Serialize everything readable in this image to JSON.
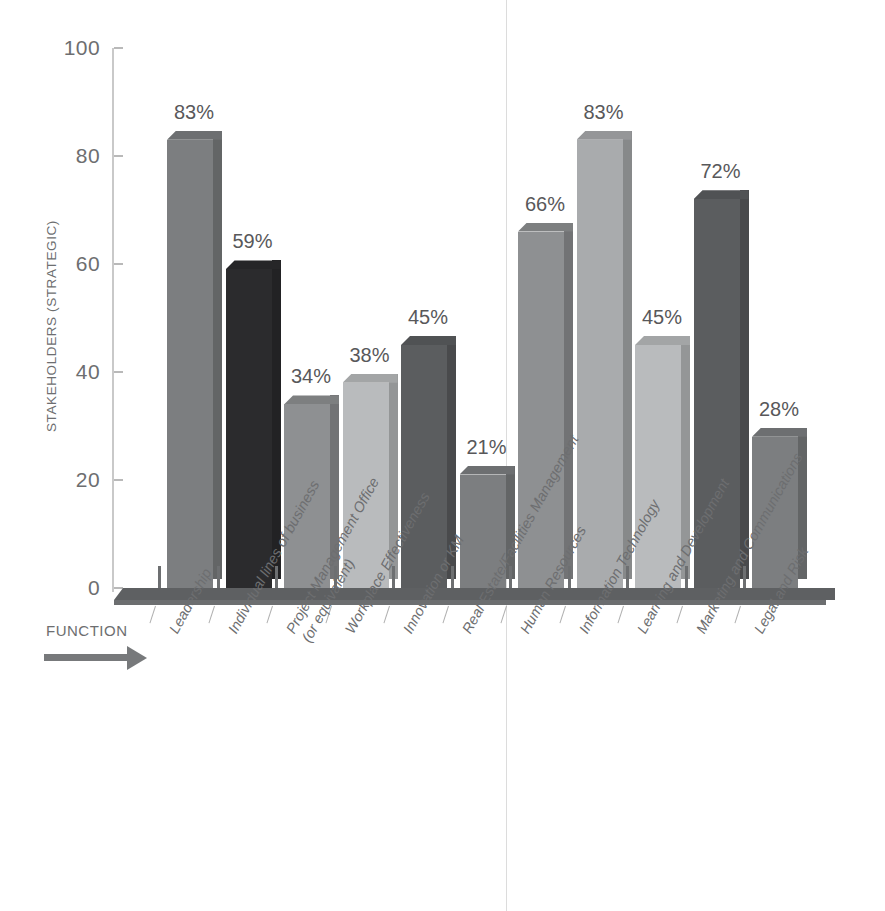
{
  "chart_data": {
    "type": "bar",
    "title": "",
    "subtitle": "",
    "xlabel": "FUNCTION",
    "ylabel": "STAKEHOLDERS (STRATEGIC)",
    "ylim": [
      0,
      100
    ],
    "yticks": [
      0,
      20,
      40,
      60,
      80,
      100
    ],
    "grid": false,
    "legend": null,
    "value_suffix": "%",
    "categories": [
      "Leadership",
      "Individual lines of business",
      "Project Management Office\n(or equivalent)",
      "Workplace Effectiveness",
      "Innovation or KM",
      "Real Estate/Facilities Management",
      "Human Resources",
      "Information Technology",
      "Learning and Development",
      "Marketing and Communications",
      "Legal and Risk"
    ],
    "values": [
      83,
      59,
      34,
      38,
      45,
      21,
      66,
      83,
      45,
      72,
      28
    ],
    "value_labels": [
      "83%",
      "59%",
      "34%",
      "38%",
      "45%",
      "21%",
      "66%",
      "83%",
      "45%",
      "72%",
      "28%"
    ],
    "bar_colors": [
      "#7c7e80",
      "#2b2b2d",
      "#8e9092",
      "#b9bbbd",
      "#5b5d5f",
      "#7c7e80",
      "#8e9092",
      "#a9abad",
      "#b9bbbd",
      "#5b5d5f",
      "#7c7e80"
    ],
    "annotations": {
      "divider_after_category_index": 5
    }
  },
  "axis": {
    "ytick_labels": [
      "0",
      "20",
      "40",
      "60",
      "80",
      "100"
    ],
    "ylabel_text": "STAKEHOLDERS (STRATEGIC)",
    "xlabel_text": "FUNCTION"
  },
  "colors": {
    "text": "#6d6e70",
    "axis": "#c9c9c9",
    "floor": "#5e6062",
    "divider": "#dcdcdc",
    "background": "#ffffff"
  }
}
